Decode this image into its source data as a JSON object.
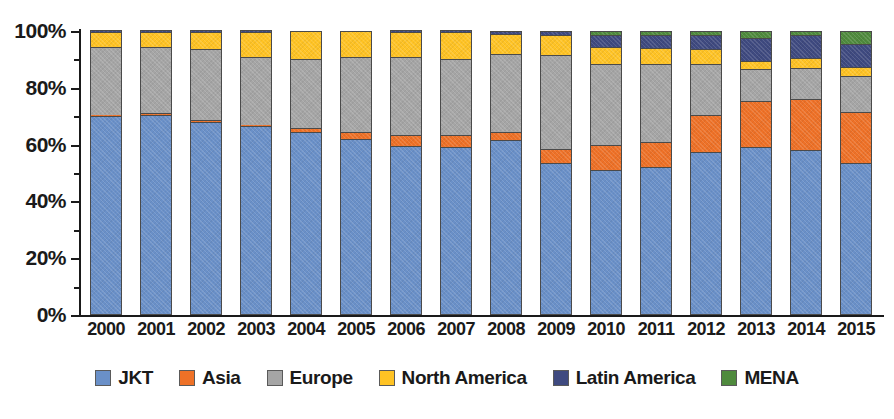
{
  "chart_data": {
    "type": "bar",
    "subtype": "stacked-100-percent",
    "title": "",
    "xlabel": "",
    "ylabel": "",
    "ylim": [
      0,
      100
    ],
    "y_tick_labels": [
      "0%",
      "20%",
      "40%",
      "60%",
      "80%",
      "100%"
    ],
    "y_tick_values": [
      0,
      20,
      40,
      60,
      80,
      100
    ],
    "y_minor_tick_values": [
      10,
      30,
      50,
      70,
      90
    ],
    "grid": false,
    "legend_position": "bottom",
    "categories": [
      "2000",
      "2001",
      "2002",
      "2003",
      "2004",
      "2005",
      "2006",
      "2007",
      "2008",
      "2009",
      "2010",
      "2011",
      "2012",
      "2013",
      "2014",
      "2015"
    ],
    "series": [
      {
        "name": "JKT",
        "color": "#6a90c8",
        "values": [
          70,
          70.5,
          68,
          66.5,
          64.5,
          62,
          59.5,
          59,
          61.5,
          53.5,
          51,
          52,
          57.5,
          59,
          58,
          53.5
        ]
      },
      {
        "name": "Asia",
        "color": "#ee7127",
        "values": [
          0.5,
          0.5,
          0.5,
          0.5,
          1.5,
          2.5,
          4,
          4.5,
          3,
          5,
          9,
          9,
          13,
          16.5,
          18,
          18
        ]
      },
      {
        "name": "Europe",
        "color": "#a5a5a5",
        "values": [
          24,
          23.5,
          25,
          24,
          24,
          26.5,
          27.5,
          26.5,
          27.5,
          33,
          28.5,
          27.5,
          18,
          11,
          11,
          12.5
        ]
      },
      {
        "name": "North America",
        "color": "#ffc324",
        "values": [
          5,
          5,
          6,
          8.5,
          10,
          9,
          8.5,
          9.5,
          7,
          7,
          6,
          5.5,
          5,
          3,
          3.5,
          3.5
        ]
      },
      {
        "name": "Latin America",
        "color": "#3f4a80"
      },
      {
        "name": "MENA",
        "color": "#4f8a3d"
      }
    ],
    "latin_america_values": [
      0.5,
      0.5,
      0.5,
      0.5,
      0,
      0,
      0.5,
      0.5,
      1,
      1.5,
      4,
      4.5,
      5,
      8,
      8,
      8
    ],
    "mena_values": [
      0,
      0,
      0,
      0,
      0,
      0,
      0,
      0,
      0,
      0,
      1.5,
      1.5,
      1.5,
      2.5,
      1.5,
      4.5
    ],
    "legend_entries": [
      {
        "label": "JKT",
        "color": "#6a90c8"
      },
      {
        "label": "Asia",
        "color": "#ee7127"
      },
      {
        "label": "Europe",
        "color": "#a5a5a5"
      },
      {
        "label": "North America",
        "color": "#ffc324"
      },
      {
        "label": "Latin America",
        "color": "#3f4a80"
      },
      {
        "label": "MENA",
        "color": "#4f8a3d"
      }
    ]
  }
}
